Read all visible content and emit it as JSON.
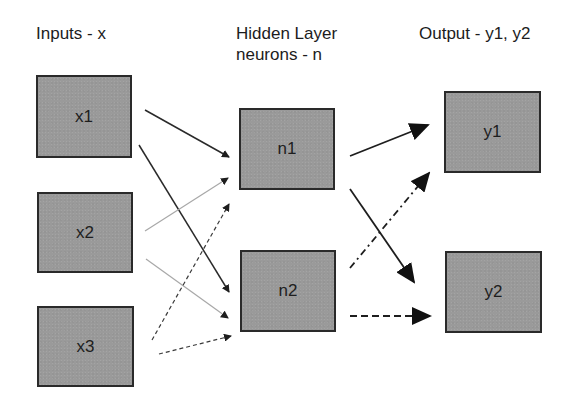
{
  "diagram": {
    "type": "neural-network",
    "columns": [
      {
        "id": "inputs",
        "title_lines": [
          "Inputs - x"
        ]
      },
      {
        "id": "hidden",
        "title_lines": [
          "Hidden Layer",
          "neurons - n"
        ]
      },
      {
        "id": "output",
        "title_lines": [
          "Output - y1, y2"
        ]
      }
    ],
    "nodes": [
      {
        "id": "x1",
        "label": "x1",
        "layer": "inputs"
      },
      {
        "id": "x2",
        "label": "x2",
        "layer": "inputs"
      },
      {
        "id": "x3",
        "label": "x3",
        "layer": "inputs"
      },
      {
        "id": "n1",
        "label": "n1",
        "layer": "hidden"
      },
      {
        "id": "n2",
        "label": "n2",
        "layer": "hidden"
      },
      {
        "id": "y1",
        "label": "y1",
        "layer": "output"
      },
      {
        "id": "y2",
        "label": "y2",
        "layer": "output"
      }
    ],
    "edges": [
      {
        "from": "x1",
        "to": "n1",
        "style": "solid-dark"
      },
      {
        "from": "x1",
        "to": "n2",
        "style": "solid-dark"
      },
      {
        "from": "x2",
        "to": "n1",
        "style": "solid-light"
      },
      {
        "from": "x2",
        "to": "n2",
        "style": "solid-light"
      },
      {
        "from": "x3",
        "to": "n1",
        "style": "dashed"
      },
      {
        "from": "x3",
        "to": "n2",
        "style": "dashed"
      },
      {
        "from": "n1",
        "to": "y1",
        "style": "solid-bold"
      },
      {
        "from": "n1",
        "to": "y2",
        "style": "solid-bold"
      },
      {
        "from": "n2",
        "to": "y1",
        "style": "dash-dot-bold"
      },
      {
        "from": "n2",
        "to": "y2",
        "style": "dashed-bold"
      }
    ],
    "colors": {
      "node_fill": "#9a9a9a",
      "node_border": "#2a2a2a",
      "edge_dark": "#2a2a2a",
      "edge_light": "#a8a8a8",
      "background": "#ffffff"
    }
  }
}
